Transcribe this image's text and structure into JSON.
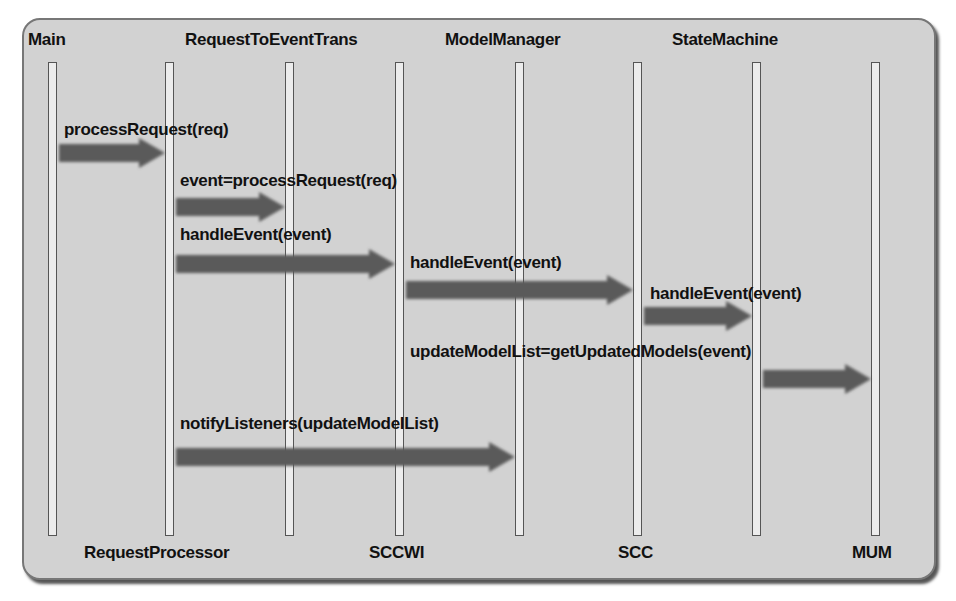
{
  "diagram": {
    "type": "sequence",
    "participants_top": [
      {
        "id": "main",
        "label": "Main"
      },
      {
        "id": "rtet",
        "label": "RequestToEventTrans"
      },
      {
        "id": "mm",
        "label": "ModelManager"
      },
      {
        "id": "sm",
        "label": "StateMachine"
      }
    ],
    "participants_bottom": [
      {
        "id": "rp",
        "label": "RequestProcessor"
      },
      {
        "id": "sccwi",
        "label": "SCCWI"
      },
      {
        "id": "scc",
        "label": "SCC"
      },
      {
        "id": "mum",
        "label": "MUM"
      }
    ],
    "lifeline_order": [
      "main",
      "rp",
      "rtet",
      "sccwi",
      "mm",
      "scc",
      "sm",
      "mum"
    ],
    "messages": [
      {
        "label": "processRequest(req)",
        "from": "main",
        "to": "rp"
      },
      {
        "label": "event=processRequest(req)",
        "from": "rp",
        "to": "rtet"
      },
      {
        "label": "handleEvent(event)",
        "from": "rp",
        "to": "sccwi"
      },
      {
        "label": "handleEvent(event)",
        "from": "sccwi",
        "to": "scc"
      },
      {
        "label": "handleEvent(event)",
        "from": "scc",
        "to": "sm"
      },
      {
        "label": "updateModelList=getUpdatedModels(event)",
        "from": "sm",
        "to": "mum"
      },
      {
        "label": "notifyListeners(updateModelList)",
        "from": "rp",
        "to": "mm"
      }
    ],
    "colors": {
      "background": "#d2d2d2",
      "arrow": "#5a5a5a",
      "border": "#777777"
    }
  }
}
